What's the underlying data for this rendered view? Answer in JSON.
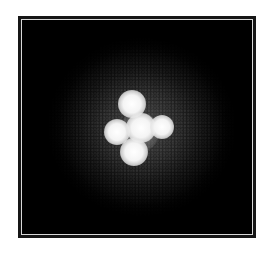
{
  "image": {
    "subject": "quadruply lensed quasar (Einstein Cross) against dark sky",
    "background_color": "#000000",
    "frame_color": "#161616",
    "frame_inner_line_color": "#d8d8d8",
    "page_background": "#ffffff",
    "sources": [
      {
        "name": "image-top",
        "cx": 132,
        "cy": 104,
        "r": 11
      },
      {
        "name": "image-left",
        "cx": 117,
        "cy": 132,
        "r": 10
      },
      {
        "name": "image-center",
        "cx": 141,
        "cy": 128,
        "r": 12
      },
      {
        "name": "image-right",
        "cx": 162,
        "cy": 127,
        "r": 9
      },
      {
        "name": "image-bottom",
        "cx": 134,
        "cy": 152,
        "r": 11
      }
    ]
  }
}
